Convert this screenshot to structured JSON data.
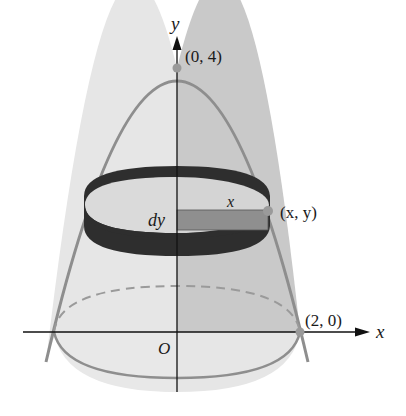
{
  "figure": {
    "type": "solid-of-revolution-paraboloid",
    "labels": {
      "y_axis": "y",
      "x_axis": "x",
      "origin": "O",
      "apex": "(0, 4)",
      "base_point": "(2, 0)",
      "point": "(x, y)",
      "radius": "x",
      "thickness": "dy"
    },
    "colors": {
      "surface_left": "#e4e4e4",
      "surface_right": "#c9c9c9",
      "outline": "#8e8e8e",
      "ring": "#2e2e2e",
      "strip": "#8f8f8f",
      "axis": "#111111",
      "point": "#9a9a9a"
    }
  }
}
